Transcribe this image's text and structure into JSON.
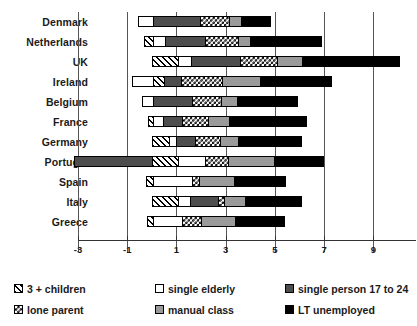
{
  "chart_data": {
    "type": "bar",
    "orientation": "horizontal",
    "stacked": true,
    "title": "",
    "xlabel": "",
    "ylabel": "",
    "xlim": [
      -3,
      10
    ],
    "xticks": [
      -3,
      -1,
      1,
      3,
      5,
      7,
      9
    ],
    "xticklabels": [
      "-3",
      "-1",
      "1",
      "3",
      "5",
      "7",
      "9"
    ],
    "grid": true,
    "gridlines_at": [
      -3,
      -1,
      1,
      3,
      5,
      7,
      9
    ],
    "legend_position": "bottom",
    "categories": [
      "Denmark",
      "Netherlands",
      "UK",
      "Ireland",
      "Belgium",
      "France",
      "Germany",
      "Portugal",
      "Spain",
      "Italy",
      "Greece"
    ],
    "series": [
      {
        "name": "3 + children",
        "pattern": "diagonal-hatch",
        "color": "#ffffff",
        "values": [
          0.0,
          0.3,
          1.05,
          0.45,
          0.0,
          0.15,
          0.65,
          1.05,
          0.25,
          1.05,
          0.2
        ]
      },
      {
        "name": "lone parent",
        "pattern": "checkerboard",
        "color": "#ffffff",
        "values": [
          1.2,
          1.35,
          1.55,
          1.7,
          1.2,
          1.05,
          1.0,
          0.95,
          0.3,
          0.25,
          0.8
        ]
      },
      {
        "name": "single elderly",
        "pattern": "solid-white",
        "color": "#ffffff",
        "values": [
          0.5,
          0.5,
          0.5,
          -0.8,
          0.4,
          0.4,
          0.3,
          1.1,
          1.6,
          0.5,
          1.2
        ]
      },
      {
        "name": "manual class",
        "pattern": "solid-light-gray",
        "color": "#9a9a9a",
        "values": [
          0.5,
          0.5,
          1.0,
          1.55,
          0.65,
          0.9,
          0.75,
          1.9,
          1.45,
          0.85,
          1.4
        ]
      },
      {
        "name": "single person 17 to 24",
        "pattern": "solid-dark-gray",
        "color": "#4d4d4d",
        "values": [
          1.95,
          1.6,
          2.0,
          0.7,
          1.6,
          0.8,
          0.8,
          -3.15,
          0.0,
          1.15,
          0.0
        ]
      },
      {
        "name": "LT unemployed",
        "pattern": "solid-black",
        "color": "#000000",
        "values": [
          1.2,
          2.9,
          4.0,
          2.9,
          2.5,
          3.15,
          2.6,
          2.0,
          2.1,
          2.3,
          2.0
        ]
      }
    ],
    "bars": [
      {
        "category": "Denmark",
        "segments": [
          {
            "series": "single elderly",
            "start": -0.55,
            "end": 0.0
          },
          {
            "series": "single person 17 to 24",
            "start": 0.0,
            "end": 1.95
          },
          {
            "series": "lone parent",
            "start": 1.95,
            "end": 3.15
          },
          {
            "series": "manual class",
            "start": 3.15,
            "end": 3.65
          },
          {
            "series": "LT unemployed",
            "start": 3.65,
            "end": 4.85
          }
        ]
      },
      {
        "category": "Netherlands",
        "segments": [
          {
            "series": "3 + children",
            "start": -0.3,
            "end": 0.0
          },
          {
            "series": "single elderly",
            "start": 0.0,
            "end": 0.5
          },
          {
            "series": "single person 17 to 24",
            "start": 0.5,
            "end": 2.15
          },
          {
            "series": "lone parent",
            "start": 2.15,
            "end": 3.5
          },
          {
            "series": "manual class",
            "start": 3.5,
            "end": 4.0
          },
          {
            "series": "LT unemployed",
            "start": 4.0,
            "end": 6.9
          }
        ]
      },
      {
        "category": "UK",
        "segments": [
          {
            "series": "3 + children",
            "start": 0.0,
            "end": 1.05
          },
          {
            "series": "single elderly",
            "start": 1.05,
            "end": 1.55
          },
          {
            "series": "single person 17 to 24",
            "start": 1.55,
            "end": 3.55
          },
          {
            "series": "lone parent",
            "start": 3.55,
            "end": 5.1
          },
          {
            "series": "manual class",
            "start": 5.1,
            "end": 6.1
          },
          {
            "series": "LT unemployed",
            "start": 6.1,
            "end": 10.1
          }
        ]
      },
      {
        "category": "Ireland",
        "segments": [
          {
            "series": "single elderly",
            "start": -0.8,
            "end": 0.0
          },
          {
            "series": "3 + children",
            "start": 0.0,
            "end": 0.45
          },
          {
            "series": "single person 17 to 24",
            "start": 0.45,
            "end": 1.15
          },
          {
            "series": "lone parent",
            "start": 1.15,
            "end": 2.85
          },
          {
            "series": "manual class",
            "start": 2.85,
            "end": 4.4
          },
          {
            "series": "LT unemployed",
            "start": 4.4,
            "end": 7.3
          }
        ]
      },
      {
        "category": "Belgium",
        "segments": [
          {
            "series": "single elderly",
            "start": -0.4,
            "end": 0.0
          },
          {
            "series": "single person 17 to 24",
            "start": 0.0,
            "end": 1.6
          },
          {
            "series": "lone parent",
            "start": 1.6,
            "end": 2.8
          },
          {
            "series": "manual class",
            "start": 2.8,
            "end": 3.45
          },
          {
            "series": "LT unemployed",
            "start": 3.45,
            "end": 5.95
          }
        ]
      },
      {
        "category": "France",
        "segments": [
          {
            "series": "3 + children",
            "start": -0.15,
            "end": 0.0
          },
          {
            "series": "single elderly",
            "start": 0.0,
            "end": 0.4
          },
          {
            "series": "single person 17 to 24",
            "start": 0.4,
            "end": 1.2
          },
          {
            "series": "lone parent",
            "start": 1.2,
            "end": 2.25
          },
          {
            "series": "manual class",
            "start": 2.25,
            "end": 3.15
          },
          {
            "series": "LT unemployed",
            "start": 3.15,
            "end": 6.3
          }
        ]
      },
      {
        "category": "Germany",
        "segments": [
          {
            "series": "3 + children",
            "start": 0.0,
            "end": 0.65
          },
          {
            "series": "single elderly",
            "start": 0.65,
            "end": 0.95
          },
          {
            "series": "single person 17 to 24",
            "start": 0.95,
            "end": 1.75
          },
          {
            "series": "lone parent",
            "start": 1.75,
            "end": 2.75
          },
          {
            "series": "manual class",
            "start": 2.75,
            "end": 3.5
          },
          {
            "series": "LT unemployed",
            "start": 3.5,
            "end": 6.1
          }
        ]
      },
      {
        "category": "Portugal",
        "segments": [
          {
            "series": "single person 17 to 24",
            "start": -3.15,
            "end": 0.0
          },
          {
            "series": "3 + children",
            "start": 0.0,
            "end": 1.05
          },
          {
            "series": "single elderly",
            "start": 1.05,
            "end": 2.15
          },
          {
            "series": "lone parent",
            "start": 2.15,
            "end": 3.1
          },
          {
            "series": "manual class",
            "start": 3.1,
            "end": 5.0
          },
          {
            "series": "LT unemployed",
            "start": 5.0,
            "end": 7.0
          }
        ]
      },
      {
        "category": "Spain",
        "segments": [
          {
            "series": "3 + children",
            "start": -0.25,
            "end": 0.0
          },
          {
            "series": "single elderly",
            "start": 0.0,
            "end": 1.6
          },
          {
            "series": "lone parent",
            "start": 1.6,
            "end": 1.9
          },
          {
            "series": "manual class",
            "start": 1.9,
            "end": 3.35
          },
          {
            "series": "LT unemployed",
            "start": 3.35,
            "end": 5.45
          }
        ]
      },
      {
        "category": "Italy",
        "segments": [
          {
            "series": "3 + children",
            "start": 0.0,
            "end": 1.05
          },
          {
            "series": "single elderly",
            "start": 1.05,
            "end": 1.55
          },
          {
            "series": "single person 17 to 24",
            "start": 1.55,
            "end": 2.7
          },
          {
            "series": "lone parent",
            "start": 2.7,
            "end": 2.95
          },
          {
            "series": "manual class",
            "start": 2.95,
            "end": 3.8
          },
          {
            "series": "LT unemployed",
            "start": 3.8,
            "end": 6.1
          }
        ]
      },
      {
        "category": "Greece",
        "segments": [
          {
            "series": "3 + children",
            "start": -0.2,
            "end": 0.0
          },
          {
            "series": "single elderly",
            "start": 0.0,
            "end": 1.2
          },
          {
            "series": "lone parent",
            "start": 1.2,
            "end": 2.0
          },
          {
            "series": "manual class",
            "start": 2.0,
            "end": 3.4
          },
          {
            "series": "LT unemployed",
            "start": 3.4,
            "end": 5.4
          }
        ]
      }
    ]
  },
  "legend": {
    "columns": [
      {
        "items": [
          {
            "label": "3 + children",
            "pattern": "diagonal-hatch"
          },
          {
            "label": "lone parent",
            "pattern": "checkerboard"
          }
        ]
      },
      {
        "items": [
          {
            "label": "single elderly",
            "pattern": "solid-white"
          },
          {
            "label": "manual class",
            "pattern": "solid-light-gray"
          }
        ]
      },
      {
        "items": [
          {
            "label": "single person 17 to 24",
            "pattern": "solid-dark-gray"
          },
          {
            "label": "LT unemployed",
            "pattern": "solid-black"
          }
        ]
      }
    ]
  }
}
